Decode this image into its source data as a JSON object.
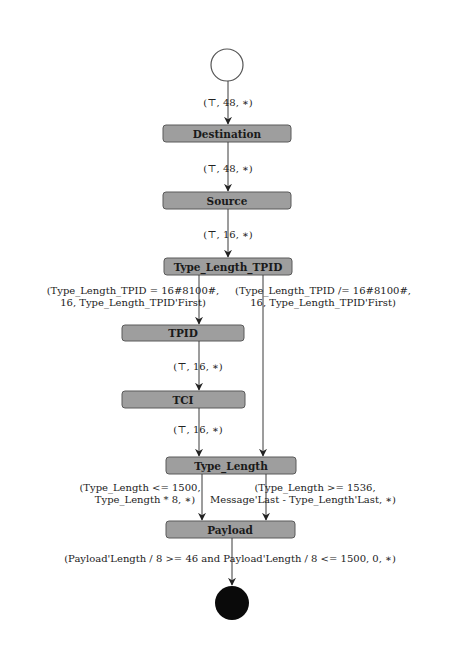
{
  "diagram": {
    "type": "state-machine",
    "colors": {
      "node_fill": "#9e9e9e",
      "node_stroke": "#5a5a5a",
      "edge": "#3a3a3a",
      "final_state": "#0a0a0a"
    },
    "nodes": {
      "start": {
        "label": ""
      },
      "destination": {
        "label": "Destination"
      },
      "source": {
        "label": "Source"
      },
      "type_length_tpid": {
        "label": "Type_Length_TPID"
      },
      "tpid": {
        "label": "TPID"
      },
      "tci": {
        "label": "TCI"
      },
      "type_length": {
        "label": "Type_Length"
      },
      "payload": {
        "label": "Payload"
      },
      "final": {
        "label": ""
      }
    },
    "edges": {
      "start_to_destination": {
        "label": "(⊤, 48, ∗)"
      },
      "destination_to_source": {
        "label": "(⊤, 48, ∗)"
      },
      "source_to_type_length_tpid": {
        "label": "(⊤, 16, ∗)"
      },
      "type_length_tpid_to_tpid": {
        "line1": "(Type_Length_TPID = 16#8100#,",
        "line2": "16, Type_Length_TPID'First)"
      },
      "type_length_tpid_to_type_length": {
        "line1": "(Type_Length_TPID /= 16#8100#,",
        "line2": "16, Type_Length_TPID'First)"
      },
      "tpid_to_tci": {
        "label": "(⊤, 16, ∗)"
      },
      "tci_to_type_length": {
        "label": "(⊤, 16, ∗)"
      },
      "type_length_to_payload_le": {
        "line1": "(Type_Length <= 1500,",
        "line2": "Type_Length * 8, ∗)"
      },
      "type_length_to_payload_ge": {
        "line1": "(Type_Length >= 1536,",
        "line2": "Message'Last - Type_Length'Last, ∗)"
      },
      "payload_to_final": {
        "label": "(Payload'Length / 8 >= 46 and Payload'Length / 8 <= 1500, 0, ∗)"
      }
    }
  }
}
